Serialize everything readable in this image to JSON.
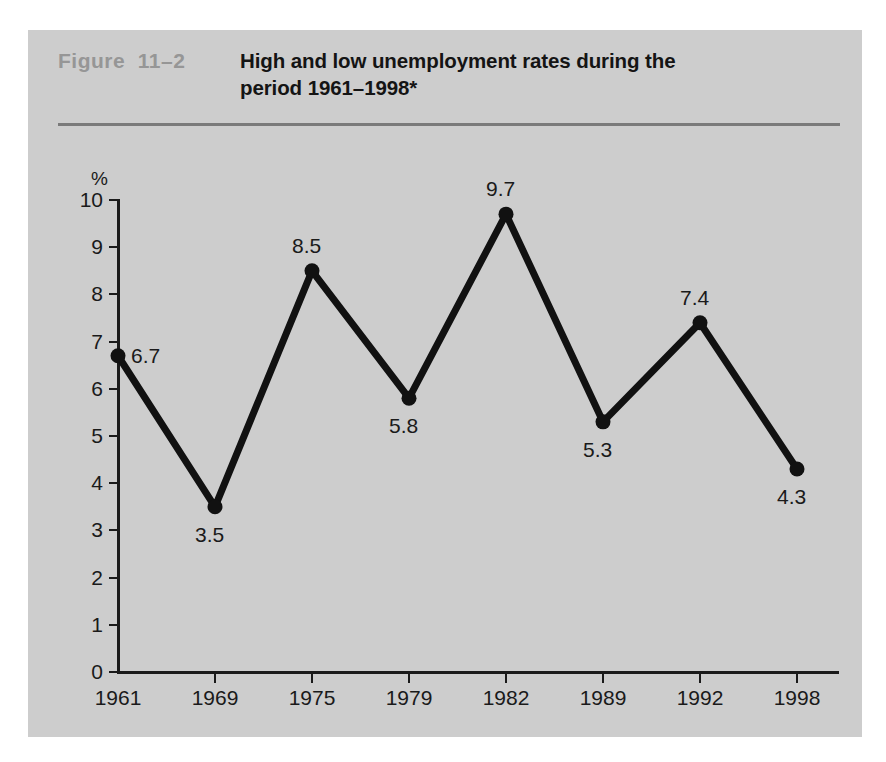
{
  "figure": {
    "number_label": "Figure  11–2",
    "title": "High and low unemployment rates during the period 1961–1998*"
  },
  "chart_data": {
    "type": "line",
    "title": "High and low unemployment rates during the period 1961–1998*",
    "xlabel": "",
    "ylabel": "%",
    "y_unit_label": "%",
    "categories": [
      "1961",
      "1969",
      "1975",
      "1979",
      "1982",
      "1989",
      "1992",
      "1998"
    ],
    "values": [
      6.7,
      3.5,
      8.5,
      5.8,
      9.7,
      5.3,
      7.4,
      4.3
    ],
    "point_labels": [
      "6.7",
      "3.5",
      "8.5",
      "5.8",
      "9.7",
      "5.3",
      "7.4",
      "4.3"
    ],
    "label_positions": [
      "right",
      "below",
      "above",
      "below",
      "above",
      "below",
      "above",
      "below"
    ],
    "ylim": [
      0,
      10
    ],
    "y_ticks": [
      0,
      1,
      2,
      3,
      4,
      5,
      6,
      7,
      8,
      9,
      10
    ],
    "y_tick_labels": [
      "0",
      "1",
      "2",
      "3",
      "4",
      "5",
      "6",
      "7",
      "8",
      "9",
      "10"
    ],
    "grid": false,
    "legend": false,
    "series_color": "#111111",
    "marker": "circle",
    "footnote_marker": "*"
  },
  "colors": {
    "panel_background": "#cdcdcd",
    "page_background": "#ffffff",
    "figure_number": "#969696",
    "title_text": "#141414",
    "rule": "#7a7a7a",
    "axis": "#1a1a1a",
    "line": "#111111"
  }
}
